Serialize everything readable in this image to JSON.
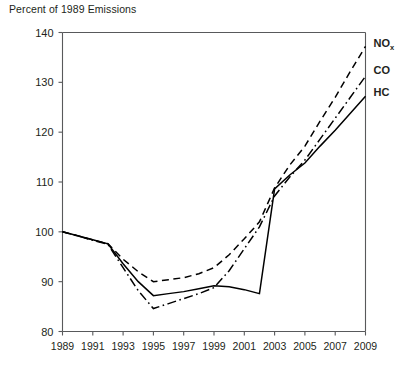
{
  "chart_title": "Percent of 1989 Emissions",
  "axis": {
    "y_ticks": [
      "80",
      "90",
      "100",
      "110",
      "120",
      "130",
      "140"
    ],
    "x_ticks": [
      "1989",
      "1991",
      "1993",
      "1995",
      "1997",
      "1999",
      "2001",
      "2003",
      "2005",
      "2007",
      "2009"
    ],
    "y_min": 80,
    "y_max": 140,
    "x_min": 1989,
    "x_max": 2009
  },
  "legend": [
    {
      "label": "NO",
      "subscript": "x",
      "name": "nox"
    },
    {
      "label": "CO",
      "subscript": "",
      "name": "co"
    },
    {
      "label": "HC",
      "subscript": "",
      "name": "hc"
    }
  ],
  "chart_data": {
    "type": "line",
    "title": "Percent of 1989 Emissions",
    "xlabel": "",
    "ylabel": "Percent of 1989 Emissions",
    "xlim": [
      1989,
      2009
    ],
    "ylim": [
      80,
      140
    ],
    "grid": false,
    "legend_position": "right",
    "x": [
      1989,
      1990,
      1991,
      1992,
      1993,
      1994,
      1995,
      1996,
      1997,
      1998,
      1999,
      2000,
      2001,
      2002,
      2003,
      2004,
      2005,
      2006,
      2007,
      2008,
      2009
    ],
    "series": [
      {
        "name": "NOx",
        "style": "dashed",
        "values": [
          100.0,
          99.2,
          98.4,
          97.6,
          94.5,
          92.0,
          90.0,
          90.4,
          90.8,
          91.6,
          92.8,
          95.4,
          98.6,
          102.0,
          108.8,
          113.4,
          117.2,
          122.2,
          127.0,
          132.2,
          137.2
        ]
      },
      {
        "name": "CO",
        "style": "dash-dot",
        "values": [
          100.0,
          99.2,
          98.3,
          97.5,
          92.8,
          88.2,
          84.6,
          85.6,
          86.6,
          87.6,
          88.8,
          92.2,
          96.6,
          101.0,
          107.2,
          111.0,
          114.4,
          118.6,
          122.8,
          127.0,
          131.2
        ]
      },
      {
        "name": "HC",
        "style": "solid",
        "values": [
          100.0,
          99.2,
          98.4,
          97.6,
          93.6,
          90.0,
          87.2,
          87.6,
          88.0,
          88.6,
          89.2,
          89.0,
          88.4,
          87.6,
          108.6,
          111.4,
          113.8,
          117.2,
          120.4,
          123.8,
          127.2
        ]
      }
    ]
  }
}
